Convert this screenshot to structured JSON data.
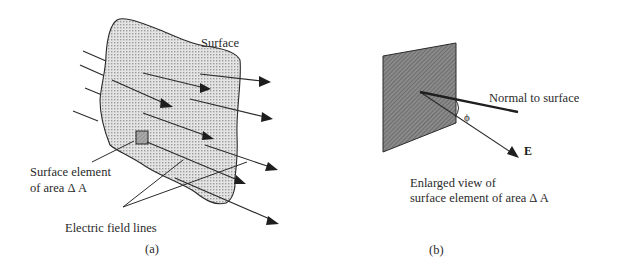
{
  "figure_a": {
    "surface_label": "Surface",
    "element_label_line1": "Surface element",
    "element_label_line2": "of area Δ A",
    "field_lines_label": "Electric field lines",
    "caption": "(a)"
  },
  "figure_b": {
    "normal_label": "Normal to surface",
    "angle_label": "ϕ",
    "field_label": "E",
    "description_line1": "Enlarged view of",
    "description_line2": "surface element of area Δ A",
    "caption": "(b)"
  },
  "colors": {
    "ink": "#2a2a2a",
    "surface_fill": "#d6d6d6",
    "element_fill": "#9a9a9a",
    "plate_fill": "#7a7a7a"
  }
}
